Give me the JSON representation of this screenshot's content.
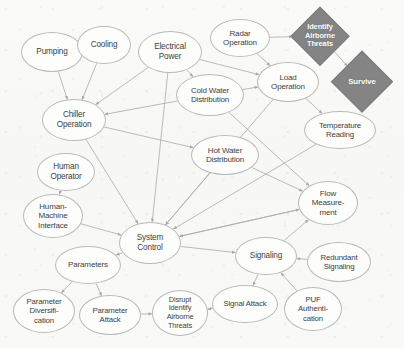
{
  "diagram": {
    "canvas": {
      "width": 404,
      "height": 348
    },
    "background_color": "#fbfbfa",
    "node_fill": "#fdfdfc",
    "node_stroke": "#b9b9b7",
    "node_text_color": "#3f3f3e",
    "diamond_fill": "#848484",
    "diamond_text_color": "#ffffff",
    "edge_color": "#a9a9a7",
    "nodes": [
      {
        "id": "pumping",
        "label": "Pumping",
        "shape": "ellipse",
        "cx": 52,
        "cy": 52,
        "rx": 31,
        "ry": 20,
        "font_size": 8.2
      },
      {
        "id": "cooling",
        "label": "Cooling",
        "shape": "ellipse",
        "cx": 104,
        "cy": 45,
        "rx": 27,
        "ry": 19,
        "font_size": 8.2
      },
      {
        "id": "electrical-power",
        "label": "Electrical\nPower",
        "shape": "ellipse",
        "cx": 170,
        "cy": 52,
        "rx": 32,
        "ry": 21,
        "font_size": 8.2
      },
      {
        "id": "radar-operation",
        "label": "Radar\nOperation",
        "shape": "ellipse",
        "cx": 240,
        "cy": 38,
        "rx": 30,
        "ry": 19,
        "font_size": 8.0
      },
      {
        "id": "identify-airborne-threats",
        "label": "Identify\nAirborne\nThreats",
        "shape": "diamond",
        "cx": 320,
        "cy": 36,
        "size": 56,
        "font_size": 7.4
      },
      {
        "id": "survive",
        "label": "Survive",
        "shape": "diamond",
        "cx": 362,
        "cy": 82,
        "size": 60,
        "font_size": 7.8
      },
      {
        "id": "cold-water-distribution",
        "label": "Cold Water\nDistribution",
        "shape": "ellipse",
        "cx": 210,
        "cy": 95,
        "rx": 34,
        "ry": 21,
        "font_size": 8.0
      },
      {
        "id": "load-operation",
        "label": "Load\nOperation",
        "shape": "ellipse",
        "cx": 288,
        "cy": 82,
        "rx": 31,
        "ry": 20,
        "font_size": 8.0
      },
      {
        "id": "temperature-reading",
        "label": "Temperature\nReading",
        "shape": "ellipse",
        "cx": 340,
        "cy": 130,
        "rx": 36,
        "ry": 19,
        "font_size": 7.8
      },
      {
        "id": "chiller-operation",
        "label": "Chiller\nOperation",
        "shape": "ellipse",
        "cx": 74,
        "cy": 120,
        "rx": 32,
        "ry": 21,
        "font_size": 8.2
      },
      {
        "id": "hot-water-distribution",
        "label": "Hot Water\nDistribution",
        "shape": "ellipse",
        "cx": 225,
        "cy": 155,
        "rx": 34,
        "ry": 20,
        "font_size": 8.0
      },
      {
        "id": "human-operator",
        "label": "Human\nOperator",
        "shape": "ellipse",
        "cx": 66,
        "cy": 172,
        "rx": 29,
        "ry": 19,
        "font_size": 8.2
      },
      {
        "id": "flow-measurement",
        "label": "Flow\nMeasure-\nment",
        "shape": "ellipse",
        "cx": 328,
        "cy": 203,
        "rx": 30,
        "ry": 22,
        "font_size": 8.0
      },
      {
        "id": "human-machine-interface",
        "label": "Human-\nMachine\nInterface",
        "shape": "ellipse",
        "cx": 53,
        "cy": 216,
        "rx": 30,
        "ry": 22,
        "font_size": 8.0
      },
      {
        "id": "system-control",
        "label": "System\nControl",
        "shape": "ellipse",
        "cx": 150,
        "cy": 243,
        "rx": 31,
        "ry": 21,
        "font_size": 8.2
      },
      {
        "id": "signaling",
        "label": "Signaling",
        "shape": "ellipse",
        "cx": 266,
        "cy": 256,
        "rx": 31,
        "ry": 19,
        "font_size": 8.2
      },
      {
        "id": "redundant-signaling",
        "label": "Redundant\nSignaling",
        "shape": "ellipse",
        "cx": 339,
        "cy": 262,
        "rx": 32,
        "ry": 20,
        "font_size": 7.8
      },
      {
        "id": "parameters",
        "label": "Parameters",
        "shape": "ellipse",
        "cx": 88,
        "cy": 265,
        "rx": 33,
        "ry": 19,
        "font_size": 8.0
      },
      {
        "id": "signal-attack",
        "label": "Signal Attack",
        "shape": "ellipse",
        "cx": 245,
        "cy": 304,
        "rx": 33,
        "ry": 19,
        "font_size": 7.8
      },
      {
        "id": "puf-authentication",
        "label": "PUF\nAuthenti-\ncation",
        "shape": "ellipse",
        "cx": 313,
        "cy": 309,
        "rx": 29,
        "ry": 22,
        "font_size": 7.8
      },
      {
        "id": "parameter-diversification",
        "label": "Parameter\nDiversifi-\ncation",
        "shape": "ellipse",
        "cx": 44,
        "cy": 311,
        "rx": 31,
        "ry": 22,
        "font_size": 7.8
      },
      {
        "id": "parameter-attack",
        "label": "Parameter\nAttack",
        "shape": "ellipse",
        "cx": 110,
        "cy": 315,
        "rx": 31,
        "ry": 20,
        "font_size": 7.8
      },
      {
        "id": "disrupt-identify-airborne-threats",
        "label": "Disrupt\nIdentify\nAirborne\nThreats",
        "shape": "ellipse",
        "cx": 180,
        "cy": 313,
        "rx": 28,
        "ry": 23,
        "font_size": 7.4
      }
    ],
    "edges": [
      {
        "from": "pumping",
        "to": "chiller-operation",
        "directed": true
      },
      {
        "from": "cooling",
        "to": "chiller-operation",
        "directed": true
      },
      {
        "from": "electrical-power",
        "to": "chiller-operation",
        "directed": true
      },
      {
        "from": "electrical-power",
        "to": "cold-water-distribution",
        "directed": true
      },
      {
        "from": "electrical-power",
        "to": "load-operation",
        "directed": true
      },
      {
        "from": "electrical-power",
        "to": "system-control",
        "directed": true
      },
      {
        "from": "radar-operation",
        "to": "identify-airborne-threats",
        "directed": true
      },
      {
        "from": "radar-operation",
        "to": "load-operation",
        "directed": true
      },
      {
        "from": "identify-airborne-threats",
        "to": "survive",
        "directed": true
      },
      {
        "from": "cold-water-distribution",
        "to": "load-operation",
        "directed": true
      },
      {
        "from": "cold-water-distribution",
        "to": "chiller-operation",
        "directed": true
      },
      {
        "from": "cold-water-distribution",
        "to": "flow-measurement",
        "directed": true
      },
      {
        "from": "load-operation",
        "to": "temperature-reading",
        "directed": true
      },
      {
        "from": "chiller-operation",
        "to": "hot-water-distribution",
        "directed": true
      },
      {
        "from": "chiller-operation",
        "to": "system-control",
        "directed": true
      },
      {
        "from": "hot-water-distribution",
        "to": "flow-measurement",
        "directed": true
      },
      {
        "from": "hot-water-distribution",
        "to": "system-control",
        "directed": true
      },
      {
        "from": "temperature-reading",
        "to": "system-control",
        "directed": true
      },
      {
        "from": "human-operator",
        "to": "human-machine-interface",
        "directed": true
      },
      {
        "from": "human-machine-interface",
        "to": "system-control",
        "directed": true
      },
      {
        "from": "load-operation",
        "to": "system-control",
        "directed": true
      },
      {
        "from": "flow-measurement",
        "to": "system-control",
        "directed": true
      },
      {
        "from": "system-control",
        "to": "signaling",
        "directed": true
      },
      {
        "from": "system-control",
        "to": "flow-measurement",
        "directed": true
      },
      {
        "from": "system-control",
        "to": "parameters",
        "directed": true
      },
      {
        "from": "signaling",
        "to": "flow-measurement",
        "directed": true
      },
      {
        "from": "redundant-signaling",
        "to": "signaling",
        "directed": true
      },
      {
        "from": "puf-authentication",
        "to": "signaling",
        "directed": true
      },
      {
        "from": "signaling",
        "to": "signal-attack",
        "directed": true
      },
      {
        "from": "signal-attack",
        "to": "disrupt-identify-airborne-threats",
        "directed": true
      },
      {
        "from": "parameters",
        "to": "parameter-diversification",
        "directed": true
      },
      {
        "from": "parameters",
        "to": "parameter-attack",
        "directed": true
      },
      {
        "from": "parameter-attack",
        "to": "disrupt-identify-airborne-threats",
        "directed": true
      }
    ]
  }
}
